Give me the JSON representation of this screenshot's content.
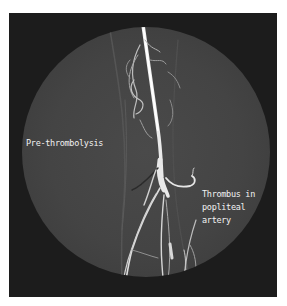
{
  "image": {
    "description": "Angiogram of the leg showing femoral and popliteal arteries",
    "labels": {
      "pre": "Pre-thrombolysis",
      "thrombus_line1": "Thrombus in",
      "thrombus_line2": "popliteal",
      "thrombus_line3": "artery"
    },
    "colors": {
      "frame": "#1c1c1c",
      "field": "#444444",
      "vessel": "#f0f0f0",
      "text": "#f2f2f2"
    }
  }
}
